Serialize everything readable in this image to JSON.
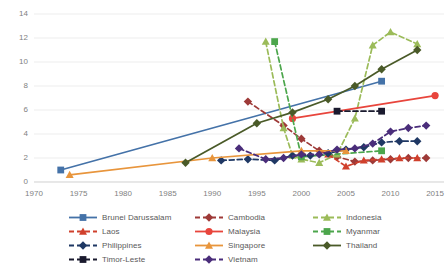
{
  "chart_data": {
    "type": "line",
    "title": "",
    "subtitle": "",
    "xlabel": "",
    "ylabel": "",
    "xlim": [
      1970,
      2016
    ],
    "ylim": [
      0,
      14
    ],
    "xticks": [
      "1970",
      "1975",
      "1980",
      "1985",
      "1990",
      "1995",
      "2000",
      "2005",
      "2010",
      "2015"
    ],
    "yticks": [
      "0",
      "2",
      "4",
      "6",
      "8",
      "10",
      "12",
      "14"
    ],
    "grid": true,
    "legend_position": "bottom",
    "series": [
      {
        "name": "Brunei Darussalam",
        "color": "#4472a8",
        "dash": "solid",
        "marker": "square",
        "points": [
          [
            1973,
            1.0
          ],
          [
            2009,
            8.4
          ]
        ]
      },
      {
        "name": "Cambodia",
        "color": "#9e3a38",
        "dash": "dashed",
        "marker": "diamond",
        "points": [
          [
            1994,
            6.7
          ],
          [
            1998,
            4.7
          ],
          [
            2000,
            3.6
          ],
          [
            2002,
            2.6
          ],
          [
            2004,
            2.1
          ],
          [
            2006,
            1.7
          ],
          [
            2008,
            1.8
          ],
          [
            2010,
            1.9
          ],
          [
            2012,
            2.0
          ],
          [
            2014,
            2.0
          ]
        ]
      },
      {
        "name": "Indonesia",
        "color": "#9bbb59",
        "dash": "dashed",
        "marker": "triangle",
        "points": [
          [
            1996,
            11.7
          ],
          [
            1998,
            4.5
          ],
          [
            1999,
            2.2
          ],
          [
            2000,
            1.9
          ],
          [
            2002,
            1.6
          ],
          [
            2004,
            2.3
          ],
          [
            2006,
            5.3
          ],
          [
            2008,
            11.4
          ],
          [
            2010,
            12.5
          ],
          [
            2013,
            11.5
          ]
        ]
      },
      {
        "name": "Laos",
        "color": "#d0402c",
        "dash": "dashed",
        "marker": "triangle",
        "points": [
          [
            2003,
            2.3
          ],
          [
            2005,
            1.3
          ],
          [
            2007,
            1.8
          ],
          [
            2009,
            1.9
          ],
          [
            2011,
            2.0
          ],
          [
            2013,
            2.0
          ]
        ]
      },
      {
        "name": "Malaysia",
        "color": "#e8453c",
        "dash": "solid",
        "marker": "circle",
        "points": [
          [
            1999,
            5.3
          ],
          [
            2015,
            7.2
          ]
        ]
      },
      {
        "name": "Myanmar",
        "color": "#4ca64c",
        "dash": "dashed",
        "marker": "square",
        "points": [
          [
            1997,
            11.7
          ],
          [
            2000,
            2.1
          ],
          [
            2009,
            2.6
          ]
        ]
      },
      {
        "name": "Philippines",
        "color": "#1f3864",
        "dash": "dashed",
        "marker": "diamond",
        "points": [
          [
            1991,
            1.8
          ],
          [
            1994,
            1.9
          ],
          [
            1997,
            1.8
          ],
          [
            1999,
            2.2
          ],
          [
            2001,
            2.2
          ],
          [
            2003,
            2.4
          ],
          [
            2005,
            2.7
          ],
          [
            2007,
            2.9
          ],
          [
            2009,
            3.3
          ],
          [
            2011,
            3.4
          ],
          [
            2013,
            3.4
          ]
        ]
      },
      {
        "name": "Singapore",
        "color": "#e8953c",
        "dash": "solid",
        "marker": "triangle",
        "points": [
          [
            1974,
            0.6
          ],
          [
            1990,
            2.0
          ],
          [
            2000,
            2.6
          ],
          [
            2005,
            2.6
          ]
        ]
      },
      {
        "name": "Thailand",
        "color": "#4a5a28",
        "dash": "solid",
        "marker": "diamond",
        "points": [
          [
            1987,
            1.6
          ],
          [
            1995,
            4.9
          ],
          [
            1999,
            5.8
          ],
          [
            2003,
            6.9
          ],
          [
            2006,
            8.0
          ],
          [
            2009,
            9.4
          ],
          [
            2013,
            11.0
          ]
        ]
      },
      {
        "name": "Timor-Leste",
        "color": "#1a1a2e",
        "dash": "dashed",
        "marker": "square",
        "points": [
          [
            2004,
            5.9
          ],
          [
            2009,
            5.9
          ]
        ]
      },
      {
        "name": "Vietnam",
        "color": "#4a2d7a",
        "dash": "dashed",
        "marker": "diamond",
        "points": [
          [
            1993,
            2.8
          ],
          [
            1996,
            1.9
          ],
          [
            1998,
            2.0
          ],
          [
            2000,
            2.3
          ],
          [
            2002,
            2.3
          ],
          [
            2004,
            2.7
          ],
          [
            2006,
            2.8
          ],
          [
            2008,
            3.2
          ],
          [
            2010,
            4.2
          ],
          [
            2012,
            4.5
          ],
          [
            2014,
            4.7
          ]
        ]
      }
    ]
  },
  "legend": {
    "items": [
      {
        "label": "Brunei Darussalam"
      },
      {
        "label": "Cambodia"
      },
      {
        "label": "Indonesia"
      },
      {
        "label": "Laos"
      },
      {
        "label": "Malaysia"
      },
      {
        "label": "Myanmar"
      },
      {
        "label": "Philippines"
      },
      {
        "label": "Singapore"
      },
      {
        "label": "Thailand"
      },
      {
        "label": "Timor-Leste"
      },
      {
        "label": "Vietnam"
      }
    ]
  }
}
